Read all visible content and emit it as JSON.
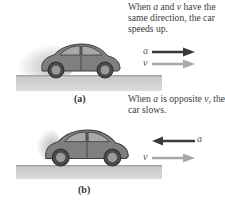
{
  "panels": [
    {
      "id": "a",
      "label": "(a)",
      "caption_parts": [
        "When ",
        "a",
        " and ",
        "v",
        " have the same direction, the car speeds up."
      ],
      "vectors": [
        {
          "symbol": "a",
          "direction": "right",
          "color": "#3a3a3a"
        },
        {
          "symbol": "v",
          "direction": "right",
          "color": "#a9a9a9"
        }
      ]
    },
    {
      "id": "b",
      "label": "(b)",
      "caption_parts": [
        "When ",
        "a",
        " is opposite ",
        "v",
        ", the car slows."
      ],
      "vectors": [
        {
          "symbol": "a",
          "direction": "left",
          "color": "#3a3a3a"
        },
        {
          "symbol": "v",
          "direction": "right",
          "color": "#a9a9a9"
        }
      ]
    }
  ],
  "colors": {
    "car_body": "#7f7f7f",
    "car_outline": "#3c3c3c",
    "window": "#a8a8a8",
    "ground": "#c9c9c9",
    "accel_arrow": "#3a3a3a",
    "velocity_arrow": "#a9a9a9"
  }
}
